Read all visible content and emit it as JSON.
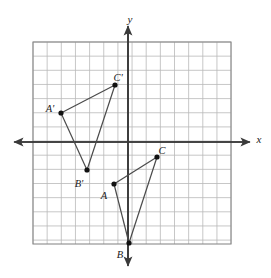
{
  "figure": {
    "background_color": "#ffffff",
    "grid_color": "#b9b9b9",
    "grid_border_color": "#8a8a8a",
    "axis_color": "#3a3a3a",
    "segment_color": "#4a4a4a",
    "point_color": "#111111",
    "label_color": "#1a1a1a"
  },
  "axes": {
    "x_label": "x",
    "y_label": "y",
    "x_label_pos": {
      "px": 259,
      "py": 140
    },
    "y_label_pos": {
      "px": 130,
      "py": 20
    },
    "origin_px": {
      "x": 128,
      "y": 142
    },
    "cell_px": 14.15,
    "x_range": [
      -6.7,
      7.3
    ],
    "y_range": [
      -7.2,
      7.1
    ],
    "x_axis_arrow_left_px": {
      "x": 14,
      "y": 142
    },
    "x_axis_arrow_right_px": {
      "x": 250,
      "y": 142
    },
    "y_axis_arrow_top_px": {
      "x": 128,
      "y": 26
    },
    "y_axis_arrow_bottom_px": {
      "x": 128,
      "y": 266
    },
    "grid_rect_px": {
      "x": 33,
      "y": 42,
      "width": 198,
      "height": 202
    },
    "grid_columns": 14,
    "grid_rows": 14
  },
  "chart_data": {
    "type": "scatter",
    "xlabel": "x",
    "ylabel": "y",
    "grid": true,
    "legend": "none",
    "xlim": [
      -6.7,
      7.3
    ],
    "ylim": [
      -7.2,
      7.1
    ],
    "series": [
      {
        "name": "Triangle ABC",
        "closed": true,
        "points": [
          {
            "label": "A",
            "x": -1,
            "y": -3
          },
          {
            "label": "B",
            "x": 0,
            "y": -7
          },
          {
            "label": "C",
            "x": 2,
            "y": -1
          }
        ]
      },
      {
        "name": "Triangle A'B'C'",
        "closed": true,
        "points": [
          {
            "label": "A'",
            "x": -4.7,
            "y": 2
          },
          {
            "label": "B'",
            "x": -2.9,
            "y": -2
          },
          {
            "label": "C'",
            "x": -0.9,
            "y": 4
          }
        ]
      }
    ]
  },
  "points": [
    {
      "name": "A-prime",
      "label": "A'",
      "px": 61,
      "py": 113,
      "label_px": 50,
      "label_py": 110
    },
    {
      "name": "B-prime",
      "label": "B'",
      "px": 87,
      "py": 170,
      "label_px": 79,
      "label_py": 185
    },
    {
      "name": "C-prime",
      "label": "C'",
      "px": 115,
      "py": 85,
      "label_px": 118,
      "label_py": 79
    },
    {
      "name": "A",
      "label": "A",
      "px": 114,
      "py": 184,
      "label_px": 104,
      "label_py": 197
    },
    {
      "name": "B",
      "label": "B",
      "px": 129,
      "py": 243,
      "label_px": 120,
      "label_py": 256
    },
    {
      "name": "C",
      "label": "C",
      "px": 157,
      "py": 157,
      "label_px": 162,
      "label_py": 152
    }
  ],
  "segments": [
    {
      "name": "segment-A-prime-C-prime",
      "x1": 61,
      "y1": 113,
      "x2": 115,
      "y2": 85
    },
    {
      "name": "segment-A-prime-B-prime",
      "x1": 61,
      "y1": 113,
      "x2": 87,
      "y2": 170
    },
    {
      "name": "segment-C-prime-B-prime",
      "x1": 115,
      "y1": 85,
      "x2": 87,
      "y2": 170
    },
    {
      "name": "segment-A-C",
      "x1": 114,
      "y1": 184,
      "x2": 157,
      "y2": 157
    },
    {
      "name": "segment-A-B",
      "x1": 114,
      "y1": 184,
      "x2": 129,
      "y2": 243
    },
    {
      "name": "segment-C-B",
      "x1": 157,
      "y1": 157,
      "x2": 129,
      "y2": 243
    }
  ]
}
